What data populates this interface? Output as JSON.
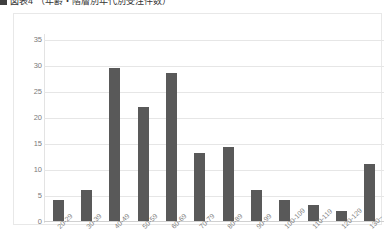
{
  "title": {
    "bullet_icon": "square-bullet-icon",
    "text": "図表4 （年齢・階層別年代別受注件数）"
  },
  "chart_data": {
    "type": "bar",
    "title": "図表4 （年齢・階層別年代別受注件数）",
    "xlabel": "",
    "ylabel": "",
    "categories": [
      "20-29",
      "30-39",
      "40-49",
      "50-59",
      "60-69",
      "70-79",
      "80-89",
      "90-99",
      "100-109",
      "110-119",
      "120-129",
      "130~"
    ],
    "values": [
      4,
      6,
      29.5,
      22,
      28.5,
      13,
      14.3,
      6,
      4,
      3,
      2,
      11
    ],
    "ylim": [
      0,
      35
    ],
    "ytick_labels": [
      "0",
      "5",
      "10",
      "15",
      "20",
      "25",
      "30",
      "35"
    ],
    "ytick_values": [
      0,
      5,
      10,
      15,
      20,
      25,
      30,
      35
    ],
    "grid": true,
    "legend": false,
    "bar_color": "#595959",
    "gridline_color": "#e6e6e6",
    "xtick_rotation_deg": -45
  }
}
